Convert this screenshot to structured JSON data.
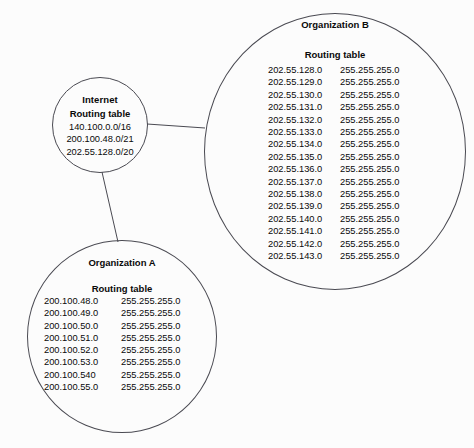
{
  "diagram": {
    "type": "network-routing-diagram",
    "background_color": "#fcfcfc",
    "stroke_color": "#4a4a52",
    "text_color": "#0a0a0a",
    "nodes": [
      {
        "id": "internet",
        "title": "Internet",
        "table_title": "Routing table",
        "prefixes": [
          "140.100.0.0/16",
          "200.100.48.0/21",
          "202.55.128.0/20"
        ]
      },
      {
        "id": "org-a",
        "title": "Organization A",
        "table_title": "Routing table",
        "routes": [
          {
            "network": "200.100.48.0",
            "mask": "255.255.255.0"
          },
          {
            "network": "200.100.49.0",
            "mask": "255.255.255.0"
          },
          {
            "network": "200.100.50.0",
            "mask": "255.255.255.0"
          },
          {
            "network": "200.100.51.0",
            "mask": "255.255.255.0"
          },
          {
            "network": "200.100.52.0",
            "mask": "255.255.255.0"
          },
          {
            "network": "200.100.53.0",
            "mask": "255.255.255.0"
          },
          {
            "network": "200.100.540",
            "mask": "255.255.255.0"
          },
          {
            "network": "200.100.55.0",
            "mask": "255.255.255.0"
          }
        ]
      },
      {
        "id": "org-b",
        "title": "Organization B",
        "table_title": "Routing table",
        "routes": [
          {
            "network": "202.55.128.0",
            "mask": "255.255.255.0"
          },
          {
            "network": "202.55.129.0",
            "mask": "255.255.255.0"
          },
          {
            "network": "202.55.130.0",
            "mask": "255.255.255.0"
          },
          {
            "network": "202.55.131.0",
            "mask": "255.255.255.0"
          },
          {
            "network": "202.55.132.0",
            "mask": "255.255.255.0"
          },
          {
            "network": "202.55.133.0",
            "mask": "255.255.255.0"
          },
          {
            "network": "202.55.134.0",
            "mask": "255.255.255.0"
          },
          {
            "network": "202.55.135.0",
            "mask": "255.255.255.0"
          },
          {
            "network": "202.55.136.0",
            "mask": "255.255.255.0"
          },
          {
            "network": "202.55.137.0",
            "mask": "255.255.255.0"
          },
          {
            "network": "202.55.138.0",
            "mask": "255.255.255.0"
          },
          {
            "network": "202.55.139.0",
            "mask": "255.255.255.0"
          },
          {
            "network": "202.55.140.0",
            "mask": "255.255.255.0"
          },
          {
            "network": "202.55.141.0",
            "mask": "255.255.255.0"
          },
          {
            "network": "202.55.142.0",
            "mask": "255.255.255.0"
          },
          {
            "network": "202.55.143.0",
            "mask": "255.255.255.0"
          }
        ]
      }
    ],
    "links": [
      {
        "from": "internet",
        "to": "org-b"
      },
      {
        "from": "internet",
        "to": "org-a"
      }
    ]
  }
}
